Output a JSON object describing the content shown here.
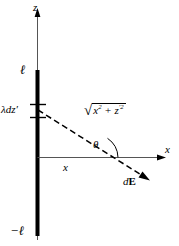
{
  "figure": {
    "background_color": "#ffffff",
    "line_color": "#000000",
    "axis_color": "#555555",
    "width": 179,
    "height": 246
  },
  "axes": {
    "vertical": {
      "name": "z-axis",
      "label": "z",
      "arrow_direction": "up"
    },
    "horizontal": {
      "name": "x-axis",
      "label": "x",
      "arrow_direction": "right"
    }
  },
  "rod": {
    "name": "charged-rod",
    "top_label": "ℓ",
    "bottom_label": "−ℓ",
    "orientation": "vertical",
    "description": "thick vertical line charge from -ℓ to ℓ"
  },
  "elements": {
    "charge_element_label": "λdz′",
    "distance_label_parts": {
      "radical_sign": "√",
      "term1_base": "x",
      "term1_exp": "2",
      "operator": "+",
      "term2_base": "z",
      "term2_prime": "′",
      "term2_exp": "2"
    },
    "angle_label": "θ",
    "horizontal_distance_label": "x",
    "field_vector_label_italic": "d",
    "field_vector_label_bold": "E"
  }
}
